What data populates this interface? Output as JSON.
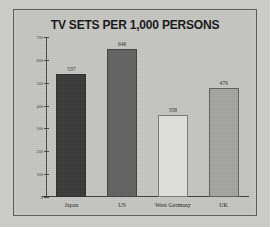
{
  "chart_data": {
    "type": "bar",
    "title": "TV SETS PER 1,000 PERSONS",
    "xlabel": "",
    "ylabel": "",
    "categories": [
      "Japan",
      "US",
      "West Germany",
      "UK"
    ],
    "values": [
      537,
      646,
      358,
      479
    ],
    "value_labels": [
      "537",
      "646",
      "358",
      "479"
    ],
    "ylim": [
      0,
      700
    ],
    "yticks": [
      0,
      100,
      200,
      300,
      400,
      500,
      600,
      700
    ],
    "ytick_labels": [
      "0",
      "100",
      "200",
      "300",
      "400",
      "500",
      "600",
      "700"
    ],
    "grid": false,
    "legend": "none",
    "bar_colors": [
      "#3a3a3a",
      "#636363",
      "#e2e2e0",
      "#a6a6a4"
    ]
  },
  "figure": {
    "background_color": "#cfcfcd",
    "panel_color": "#c7c7c3",
    "frame_color": "#5d5d59",
    "axis_color": "#3e3e3c",
    "text_color": "#17171a"
  }
}
